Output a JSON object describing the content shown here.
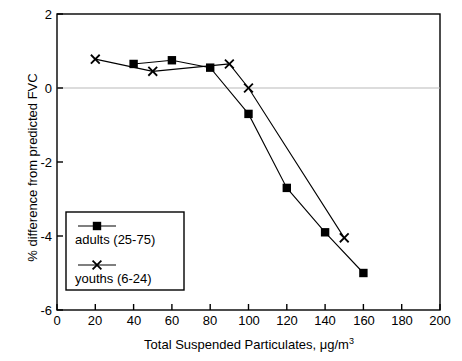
{
  "chart_data": {
    "type": "line",
    "title": "",
    "xlabel": "Total Suspended Particulates, μg/m",
    "xlabel_sup": "3",
    "ylabel": "% difference from predicted FVC",
    "xlim": [
      0,
      200
    ],
    "ylim": [
      -6,
      2
    ],
    "xticks": [
      0,
      20,
      40,
      60,
      80,
      100,
      120,
      140,
      160,
      180,
      200
    ],
    "yticks": [
      2,
      0,
      -2,
      -4,
      -6
    ],
    "grid": false,
    "zero_line": true,
    "legend_position": "lower-left-inset",
    "series": [
      {
        "name": "adults (25-75)",
        "marker": "square",
        "x": [
          40,
          60,
          80,
          100,
          120,
          140,
          160
        ],
        "y": [
          0.65,
          0.75,
          0.55,
          -0.7,
          -2.7,
          -3.9,
          -5.0
        ]
      },
      {
        "name": "youths (6-24)",
        "marker": "cross",
        "x": [
          20,
          50,
          90,
          100,
          150
        ],
        "y": [
          0.78,
          0.45,
          0.65,
          0.0,
          -4.05
        ]
      }
    ]
  },
  "axis_tick_labels": {
    "x": [
      "0",
      "20",
      "40",
      "60",
      "80",
      "100",
      "120",
      "140",
      "160",
      "180",
      "200"
    ],
    "y": [
      "2",
      "0",
      "-2",
      "-4",
      "-6"
    ]
  },
  "legend": {
    "entries": [
      {
        "label": "adults (25-75)",
        "marker": "square-marker"
      },
      {
        "label": "youths (6-24)",
        "marker": "cross-marker"
      }
    ]
  },
  "colors": {
    "line": "#000000",
    "marker": "#000000",
    "axis": "#000000",
    "zero_line": "#b4b4b4",
    "background": "#ffffff"
  }
}
